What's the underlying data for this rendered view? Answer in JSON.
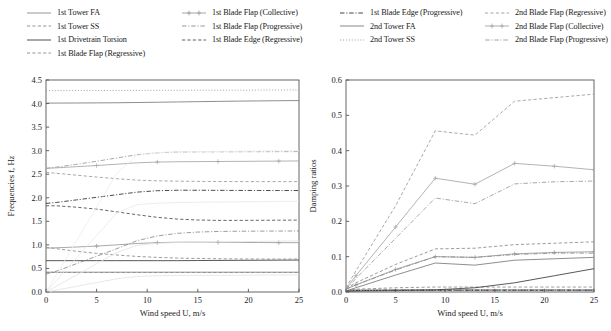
{
  "figure": {
    "background": "#ffffff",
    "text_color": "#1a1a1a"
  },
  "legend": {
    "columns": [
      {
        "x": 0,
        "items": [
          {
            "label": "1st Tower FA",
            "style": "solid",
            "color": "#8a8a8a",
            "marker": "none"
          },
          {
            "label": "1st Tower SS",
            "style": "dashed",
            "color": "#8a8a8a",
            "marker": "none"
          },
          {
            "label": "1st Drivetrain Torsion",
            "style": "solid",
            "color": "#3a3a3a",
            "marker": "none"
          },
          {
            "label": "1st Blade Flap (Regressive)",
            "style": "dashed",
            "color": "#8a8a8a",
            "marker": "none"
          }
        ]
      },
      {
        "x": 155,
        "items": [
          {
            "label": "1st Blade Flap (Collective)",
            "style": "solid",
            "color": "#9a9a9a",
            "marker": "plus"
          },
          {
            "label": "1st Blade Flap (Progressive)",
            "style": "dashdot",
            "color": "#8a8a8a",
            "marker": "none"
          },
          {
            "label": "1st Blade Edge (Regressive)",
            "style": "dashed",
            "color": "#4a4a4a",
            "marker": "none"
          }
        ]
      },
      {
        "x": 313,
        "items": [
          {
            "label": "1st Blade Edge (Progressive)",
            "style": "dashdot",
            "color": "#2a2a2a",
            "marker": "none"
          },
          {
            "label": "2nd Tower FA",
            "style": "solid",
            "color": "#7a7a7a",
            "marker": "none"
          },
          {
            "label": "2nd Tower SS",
            "style": "dotted",
            "color": "#9a9a9a",
            "marker": "none"
          }
        ]
      },
      {
        "x": 458,
        "items": [
          {
            "label": "2nd Blade Flap (Regressive)",
            "style": "dashed",
            "color": "#9a9a9a",
            "marker": "none"
          },
          {
            "label": "2nd Blade Flap (Collective)",
            "style": "solid",
            "color": "#a5a5a5",
            "marker": "plus"
          },
          {
            "label": "2nd Blade Flap (Progressive)",
            "style": "dashdot",
            "color": "#9a9a9a",
            "marker": "none"
          }
        ]
      }
    ]
  },
  "chart_data": [
    {
      "id": "frequencies",
      "type": "line",
      "title": "",
      "xlabel": "Wind speed U, m/s",
      "ylabel": "Frequencies f, Hz",
      "xlim": [
        0,
        25
      ],
      "ylim": [
        0.0,
        4.5
      ],
      "xticks": [
        0,
        5,
        10,
        15,
        20,
        25
      ],
      "yticks": [
        0.0,
        0.5,
        1.0,
        1.5,
        2.0,
        2.5,
        3.0,
        3.5,
        4.0,
        4.5
      ],
      "xticklabels": [
        "0",
        "5",
        "10",
        "15",
        "20",
        "25"
      ],
      "yticklabels": [
        "0.0",
        "0.5",
        "1.0",
        "1.5",
        "2.0",
        "2.5",
        "3.0",
        "3.5",
        "4.0",
        "4.5"
      ],
      "grid": false,
      "legend_position": "above-figure",
      "x": [
        0,
        1,
        3,
        5,
        7,
        9,
        11,
        13,
        15,
        17,
        19,
        21,
        23,
        25
      ],
      "series": [
        {
          "name": "1st Tower FA",
          "style": "solid",
          "color": "#8a8a8a",
          "marker": "none",
          "values": [
            0.42,
            0.42,
            0.42,
            0.42,
            0.42,
            0.42,
            0.42,
            0.42,
            0.42,
            0.42,
            0.42,
            0.42,
            0.42,
            0.42
          ]
        },
        {
          "name": "1st Tower SS",
          "style": "dashed",
          "color": "#8a8a8a",
          "marker": "none",
          "values": [
            0.415,
            0.415,
            0.415,
            0.415,
            0.415,
            0.415,
            0.415,
            0.415,
            0.415,
            0.415,
            0.415,
            0.415,
            0.415,
            0.415
          ]
        },
        {
          "name": "1st Drivetrain Torsion",
          "style": "solid",
          "color": "#3a3a3a",
          "marker": "none",
          "values": [
            0.665,
            0.665,
            0.665,
            0.665,
            0.665,
            0.665,
            0.665,
            0.665,
            0.668,
            0.67,
            0.672,
            0.674,
            0.676,
            0.678
          ]
        },
        {
          "name": "1st Blade Flap (Regressive)",
          "style": "dashed",
          "color": "#8a8a8a",
          "marker": "none",
          "values": [
            0.95,
            0.92,
            0.865,
            0.82,
            0.785,
            0.755,
            0.735,
            0.72,
            0.712,
            0.706,
            0.702,
            0.7,
            0.699,
            0.7
          ]
        },
        {
          "name": "1st Blade Flap (Collective)",
          "style": "solid",
          "color": "#9a9a9a",
          "marker": "plus",
          "values": [
            0.93,
            0.938,
            0.955,
            0.975,
            1.0,
            1.03,
            1.048,
            1.057,
            1.058,
            1.055,
            1.052,
            1.05,
            1.048,
            1.047
          ]
        },
        {
          "name": "1st Blade Flap (Progressive)",
          "style": "dashdot",
          "color": "#8a8a8a",
          "marker": "none",
          "values": [
            0.38,
            0.44,
            0.6,
            0.76,
            0.92,
            1.09,
            1.19,
            1.245,
            1.272,
            1.285,
            1.29,
            1.292,
            1.294,
            1.296
          ]
        },
        {
          "name": "1st Blade Edge (Regressive)",
          "style": "dashed",
          "color": "#4a4a4a",
          "marker": "none",
          "values": [
            1.83,
            1.83,
            1.8,
            1.76,
            1.7,
            1.64,
            1.585,
            1.548,
            1.528,
            1.52,
            1.52,
            1.522,
            1.524,
            1.526
          ]
        },
        {
          "name": "1st Blade Edge (Progressive)",
          "style": "dashdot",
          "color": "#2a2a2a",
          "marker": "none",
          "values": [
            1.88,
            1.9,
            1.955,
            2.01,
            2.065,
            2.12,
            2.15,
            2.16,
            2.16,
            2.158,
            2.156,
            2.155,
            2.154,
            2.154
          ]
        },
        {
          "name": "2nd Tower FA",
          "style": "solid",
          "color": "#7a7a7a",
          "marker": "none",
          "values": [
            4.01,
            4.01,
            4.012,
            4.014,
            4.017,
            4.022,
            4.028,
            4.034,
            4.04,
            4.046,
            4.052,
            4.056,
            4.06,
            4.064
          ]
        },
        {
          "name": "2nd Tower SS",
          "style": "dotted",
          "color": "#9a9a9a",
          "marker": "none",
          "values": [
            4.275,
            4.275,
            4.276,
            4.277,
            4.278,
            4.28,
            4.281,
            4.282,
            4.283,
            4.284,
            4.285,
            4.286,
            4.287,
            4.288
          ]
        },
        {
          "name": "2nd Blade Flap (Regressive)",
          "style": "dashed",
          "color": "#9a9a9a",
          "marker": "none",
          "values": [
            2.54,
            2.52,
            2.48,
            2.44,
            2.405,
            2.375,
            2.36,
            2.352,
            2.348,
            2.345,
            2.344,
            2.343,
            2.343,
            2.343
          ]
        },
        {
          "name": "2nd Blade Flap (Collective)",
          "style": "solid",
          "color": "#a5a5a5",
          "marker": "plus",
          "values": [
            2.625,
            2.635,
            2.66,
            2.685,
            2.712,
            2.742,
            2.758,
            2.765,
            2.768,
            2.77,
            2.773,
            2.776,
            2.779,
            2.782
          ]
        },
        {
          "name": "2nd Blade Flap (Progressive)",
          "style": "dashdot",
          "color": "#9a9a9a",
          "marker": "none",
          "values": [
            2.625,
            2.65,
            2.71,
            2.775,
            2.845,
            2.915,
            2.955,
            2.972,
            2.975,
            2.976,
            2.977,
            2.978,
            2.979,
            2.98
          ]
        },
        {
          "name": "rotor-harmonic-1",
          "style": "solid",
          "color": "#e2e2e2",
          "marker": "none",
          "values": [
            0.0,
            0.04,
            0.12,
            0.2,
            0.28,
            0.33,
            0.345,
            0.35,
            0.352,
            0.354,
            0.356,
            0.358,
            0.36,
            0.362
          ]
        },
        {
          "name": "rotor-harmonic-3",
          "style": "solid",
          "color": "#e2e2e2",
          "marker": "none",
          "values": [
            0.0,
            0.12,
            0.36,
            0.6,
            0.84,
            0.99,
            1.035,
            1.05,
            1.056,
            1.062,
            1.068,
            1.074,
            1.08,
            1.086
          ]
        },
        {
          "name": "rotor-harmonic-6",
          "style": "solid",
          "color": "#e8e8e8",
          "marker": "none",
          "values": [
            0.0,
            0.24,
            0.72,
            1.2,
            1.68,
            1.855,
            1.885,
            1.9,
            1.905,
            1.91,
            1.914,
            1.918,
            1.922,
            1.926
          ]
        },
        {
          "name": "rotor-harmonic-9",
          "style": "solid",
          "color": "#ececec",
          "marker": "none",
          "values": [
            0.0,
            0.36,
            1.08,
            1.8,
            2.52,
            2.9,
            2.96,
            2.975,
            2.98,
            2.984,
            2.988,
            2.992,
            2.996,
            3.0
          ]
        }
      ]
    },
    {
      "id": "damping-ratios",
      "type": "line",
      "title": "",
      "xlabel": "Wind speed U, m/s",
      "ylabel": "Damping ratios",
      "xlim": [
        0,
        25
      ],
      "ylim": [
        0.0,
        0.6
      ],
      "xticks": [
        0,
        5,
        10,
        15,
        20,
        25
      ],
      "yticks": [
        0.0,
        0.1,
        0.2,
        0.3,
        0.4,
        0.5,
        0.6
      ],
      "xticklabels": [
        "0",
        "5",
        "10",
        "15",
        "20",
        "25"
      ],
      "yticklabels": [
        "0.0",
        "0.1",
        "0.2",
        "0.3",
        "0.4",
        "0.5",
        "0.6"
      ],
      "grid": false,
      "legend_position": "above-figure",
      "x": [
        0,
        1,
        5,
        9,
        13,
        17,
        21,
        25
      ],
      "series": [
        {
          "name": "1st Tower FA",
          "style": "solid",
          "color": "#8a8a8a",
          "marker": "none",
          "values": [
            0.004,
            0.006,
            0.006,
            0.006,
            0.006,
            0.006,
            0.006,
            0.006
          ]
        },
        {
          "name": "1st Tower SS",
          "style": "dashed",
          "color": "#8a8a8a",
          "marker": "none",
          "values": [
            0.004,
            0.008,
            0.012,
            0.014,
            0.014,
            0.014,
            0.014,
            0.014
          ]
        },
        {
          "name": "1st Drivetrain Torsion",
          "style": "solid",
          "color": "#3a3a3a",
          "marker": "none",
          "values": [
            0.002,
            0.003,
            0.004,
            0.006,
            0.012,
            0.026,
            0.046,
            0.066
          ]
        },
        {
          "name": "1st Blade Flap (Regressive)",
          "style": "dashed",
          "color": "#8a8a8a",
          "marker": "none",
          "values": [
            0.01,
            0.026,
            0.078,
            0.122,
            0.124,
            0.134,
            0.138,
            0.142
          ]
        },
        {
          "name": "1st Blade Flap (Collective)",
          "style": "solid",
          "color": "#9a9a9a",
          "marker": "plus",
          "values": [
            0.008,
            0.02,
            0.064,
            0.1,
            0.098,
            0.108,
            0.112,
            0.114
          ]
        },
        {
          "name": "1st Blade Flap (Progressive)",
          "style": "dashdot",
          "color": "#8a8a8a",
          "marker": "none",
          "values": [
            0.008,
            0.02,
            0.062,
            0.1,
            0.098,
            0.106,
            0.11,
            0.11
          ]
        },
        {
          "name": "1st Blade Edge (Regressive)",
          "style": "dashed",
          "color": "#4a4a4a",
          "marker": "none",
          "values": [
            0.004,
            0.004,
            0.005,
            0.005,
            0.005,
            0.005,
            0.005,
            0.005
          ]
        },
        {
          "name": "1st Blade Edge (Progressive)",
          "style": "dashdot",
          "color": "#2a2a2a",
          "marker": "none",
          "values": [
            0.004,
            0.004,
            0.005,
            0.005,
            0.005,
            0.005,
            0.005,
            0.005
          ]
        },
        {
          "name": "2nd Tower FA",
          "style": "solid",
          "color": "#7a7a7a",
          "marker": "none",
          "values": [
            0.003,
            0.012,
            0.048,
            0.082,
            0.076,
            0.09,
            0.094,
            0.098
          ]
        },
        {
          "name": "2nd Tower SS",
          "style": "dotted",
          "color": "#9a9a9a",
          "marker": "none",
          "values": [
            0.004,
            0.004,
            0.005,
            0.005,
            0.005,
            0.005,
            0.005,
            0.005
          ]
        },
        {
          "name": "2nd Blade Flap (Regressive)",
          "style": "dashed",
          "color": "#9a9a9a",
          "marker": "none",
          "values": [
            0.012,
            0.06,
            0.244,
            0.456,
            0.444,
            0.54,
            0.55,
            0.56
          ]
        },
        {
          "name": "2nd Blade Flap (Collective)",
          "style": "solid",
          "color": "#a5a5a5",
          "marker": "plus",
          "values": [
            0.01,
            0.046,
            0.184,
            0.322,
            0.305,
            0.364,
            0.356,
            0.346
          ]
        },
        {
          "name": "2nd Blade Flap (Progressive)",
          "style": "dashdot",
          "color": "#9a9a9a",
          "marker": "none",
          "values": [
            0.008,
            0.038,
            0.152,
            0.266,
            0.25,
            0.306,
            0.312,
            0.314
          ]
        }
      ]
    }
  ]
}
